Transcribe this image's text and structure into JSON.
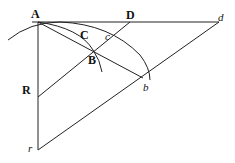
{
  "diagram": {
    "labels": {
      "A": "A",
      "D": "D",
      "d": "d",
      "C": "C",
      "c": "c",
      "B": "B",
      "b": "b",
      "R": "R",
      "r": "r"
    },
    "points": {
      "A": [
        38,
        22
      ],
      "D": [
        130,
        22
      ],
      "d": [
        219,
        22
      ],
      "B": [
        93,
        50
      ],
      "b": [
        143,
        78
      ],
      "R": [
        38,
        97
      ],
      "r": [
        38,
        150
      ]
    },
    "stroke_color": "#222222"
  }
}
